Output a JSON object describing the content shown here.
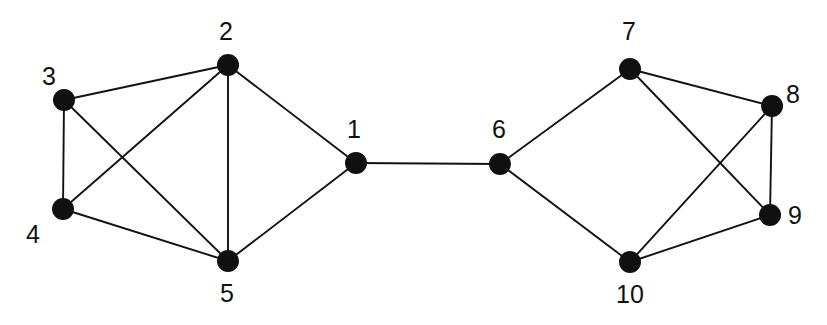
{
  "figure": {
    "width": 827,
    "height": 325,
    "background_color": "#ffffff"
  },
  "style": {
    "node_color": "#101010",
    "node_radius": 11,
    "edge_color": "#121212",
    "edge_width": 1.9,
    "label_color": "#111111",
    "label_font_size": 25
  },
  "chart_data": {
    "type": "diagram",
    "graph_type": "undirected",
    "node_count": 10,
    "edge_count": 13,
    "title": "",
    "nodes": [
      {
        "id": "1",
        "label": "1",
        "x": 356,
        "y": 163,
        "label_x": 354,
        "label_y": 131,
        "label_position": "above"
      },
      {
        "id": "2",
        "label": "2",
        "x": 228,
        "y": 65,
        "label_x": 226,
        "label_y": 33,
        "label_position": "above"
      },
      {
        "id": "3",
        "label": "3",
        "x": 64,
        "y": 100,
        "label_x": 49,
        "label_y": 78,
        "label_position": "above-left"
      },
      {
        "id": "4",
        "label": "4",
        "x": 63,
        "y": 209,
        "label_x": 33,
        "label_y": 236,
        "label_position": "below-left"
      },
      {
        "id": "5",
        "label": "5",
        "x": 228,
        "y": 261,
        "label_x": 227,
        "label_y": 295,
        "label_position": "below"
      },
      {
        "id": "6",
        "label": "6",
        "x": 500,
        "y": 164,
        "label_x": 499,
        "label_y": 131,
        "label_position": "above"
      },
      {
        "id": "7",
        "label": "7",
        "x": 630,
        "y": 69,
        "label_x": 629,
        "label_y": 33,
        "label_position": "above"
      },
      {
        "id": "8",
        "label": "8",
        "x": 772,
        "y": 106,
        "label_x": 793,
        "label_y": 96,
        "label_position": "upper-right"
      },
      {
        "id": "9",
        "label": "9",
        "x": 770,
        "y": 215,
        "label_x": 795,
        "label_y": 217,
        "label_position": "right"
      },
      {
        "id": "10",
        "label": "10",
        "x": 630,
        "y": 262,
        "label_x": 630,
        "label_y": 296,
        "label_position": "below"
      }
    ],
    "edges": [
      {
        "source": "1",
        "target": "2"
      },
      {
        "source": "1",
        "target": "5"
      },
      {
        "source": "1",
        "target": "6"
      },
      {
        "source": "2",
        "target": "3"
      },
      {
        "source": "2",
        "target": "4"
      },
      {
        "source": "2",
        "target": "5"
      },
      {
        "source": "3",
        "target": "4"
      },
      {
        "source": "3",
        "target": "5"
      },
      {
        "source": "4",
        "target": "5"
      },
      {
        "source": "6",
        "target": "7"
      },
      {
        "source": "6",
        "target": "10"
      },
      {
        "source": "7",
        "target": "8"
      },
      {
        "source": "7",
        "target": "9"
      },
      {
        "source": "8",
        "target": "9"
      },
      {
        "source": "8",
        "target": "10"
      },
      {
        "source": "9",
        "target": "10"
      }
    ]
  }
}
